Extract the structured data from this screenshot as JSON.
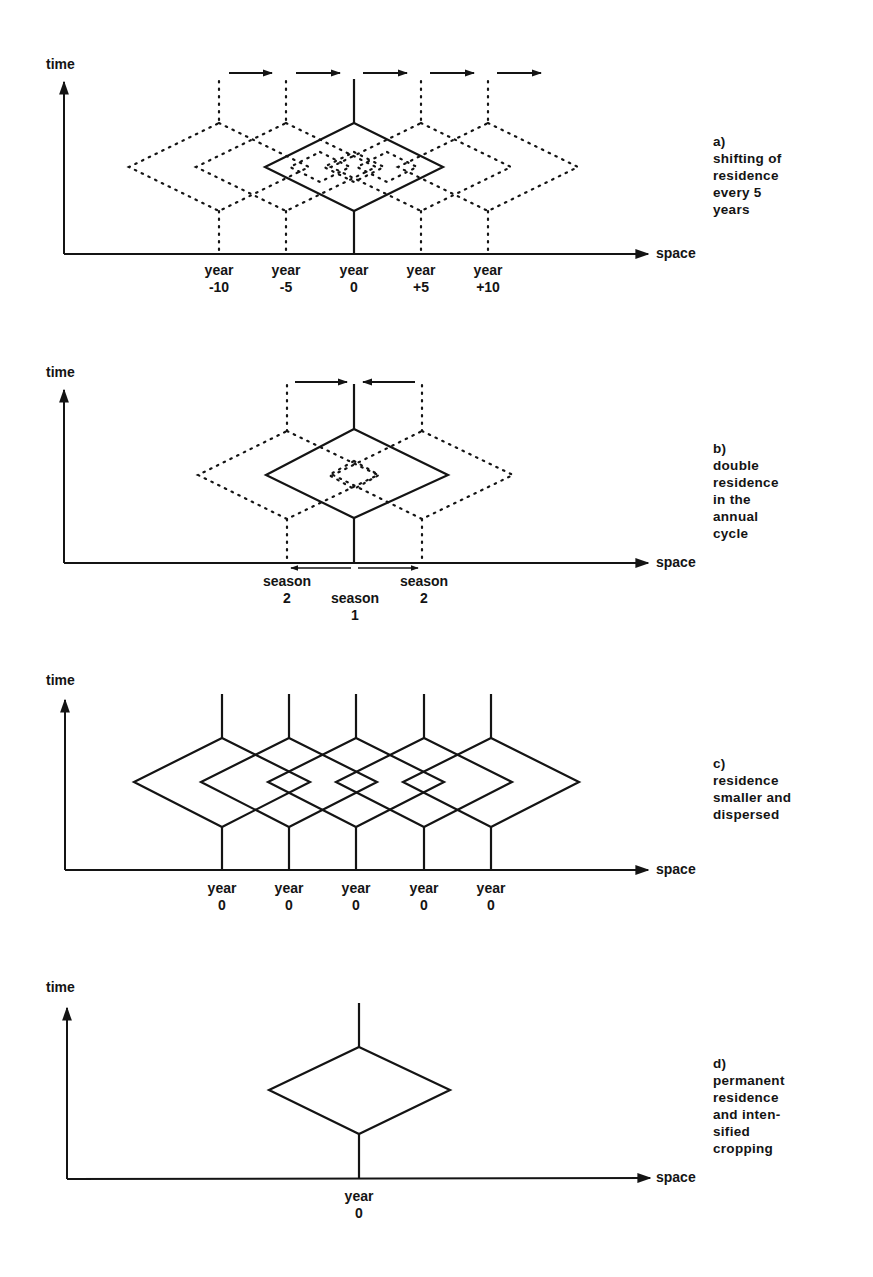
{
  "figure": {
    "panels": [
      {
        "id": "a",
        "y_axis_label": "time",
        "x_axis_label": "space",
        "caption_letter": "a)",
        "caption_lines": [
          "shifting of",
          "residence",
          "every 5",
          "years"
        ],
        "ticks": [
          {
            "line1": "year",
            "line2": "-10"
          },
          {
            "line1": "year",
            "line2": "-5"
          },
          {
            "line1": "year",
            "line2": "0"
          },
          {
            "line1": "year",
            "line2": "+5"
          },
          {
            "line1": "year",
            "line2": "+10"
          }
        ]
      },
      {
        "id": "b",
        "y_axis_label": "time",
        "x_axis_label": "space",
        "caption_letter": "b)",
        "caption_lines": [
          "double",
          "residence",
          "in the",
          "annual",
          "cycle"
        ],
        "ticks": [
          {
            "line1": "season",
            "line2": "2"
          },
          {
            "line1": "season",
            "line2": "1"
          },
          {
            "line1": "season",
            "line2": "2"
          }
        ]
      },
      {
        "id": "c",
        "y_axis_label": "time",
        "x_axis_label": "space",
        "caption_letter": "c)",
        "caption_lines": [
          "residence",
          "smaller and",
          "dispersed"
        ],
        "ticks": [
          {
            "line1": "year",
            "line2": "0"
          },
          {
            "line1": "year",
            "line2": "0"
          },
          {
            "line1": "year",
            "line2": "0"
          },
          {
            "line1": "year",
            "line2": "0"
          },
          {
            "line1": "year",
            "line2": "0"
          }
        ]
      },
      {
        "id": "d",
        "y_axis_label": "time",
        "x_axis_label": "space",
        "caption_letter": "d)",
        "caption_lines": [
          "permanent",
          "residence",
          "and inten-",
          "sified",
          "cropping"
        ],
        "ticks": [
          {
            "line1": "year",
            "line2": "0"
          }
        ]
      }
    ],
    "colors": {
      "ink": "#141414",
      "background": "#ffffff"
    }
  }
}
